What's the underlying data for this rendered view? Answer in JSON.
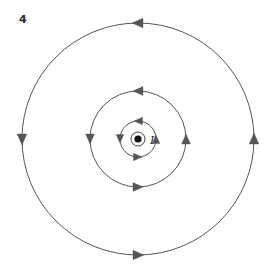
{
  "figure": {
    "number_label": "4",
    "background_color": "#ffffff",
    "width": 271,
    "height": 273
  },
  "diagram": {
    "type": "concentric-field-lines",
    "line_color": "#555555",
    "arrow_color": "#555555",
    "center": {
      "x": 138,
      "y": 139
    },
    "circulation_direction": "counterclockwise",
    "field_lines": [
      {
        "name": "inner-field-line",
        "radius": 18
      },
      {
        "name": "middle-field-line",
        "radius": 48
      },
      {
        "name": "outer-field-line",
        "radius": 116
      }
    ],
    "arrow_positions": [
      "top",
      "left",
      "right",
      "bottom"
    ],
    "arrow_directions": {
      "top": "left",
      "left": "down",
      "right": "up",
      "bottom": "right"
    }
  },
  "wire": {
    "symbol_name": "current-out-of-page-dot",
    "ring_radius": 7,
    "dot_radius": 3.6,
    "ring_color": "#444444",
    "dot_color": "#111111",
    "current_label": "I",
    "current_label_position": {
      "x": 150,
      "y": 144
    }
  }
}
